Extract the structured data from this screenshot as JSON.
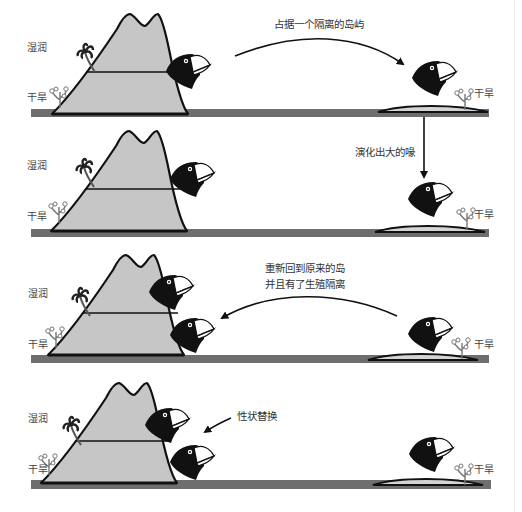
{
  "labels": {
    "wet": "湿润",
    "dry": "干旱"
  },
  "colors": {
    "ground": "#6e6e6e",
    "mountain_fill": "#c6c6c6",
    "outline": "#111111",
    "bird": "#111111",
    "beak": "#ffffff"
  },
  "panels": [
    {
      "step": 1,
      "caption_lines": [
        "占据一个隔离的岛屿"
      ],
      "arrow": "curved-right-down",
      "mainland_birds": 1,
      "island_birds": 1
    },
    {
      "step": 2,
      "caption_lines": [
        "演化出大的喙"
      ],
      "arrow": "straight-down",
      "mainland_birds": 1,
      "island_birds": 1
    },
    {
      "step": 3,
      "caption_lines": [
        "重新回到原来的岛",
        "并且有了生殖隔离"
      ],
      "arrow": "curved-left",
      "mainland_birds": 2,
      "island_birds": 1
    },
    {
      "step": 4,
      "caption_lines": [
        "性状替换"
      ],
      "arrow": "short-left-down",
      "mainland_birds": 2,
      "island_birds": 1
    }
  ]
}
